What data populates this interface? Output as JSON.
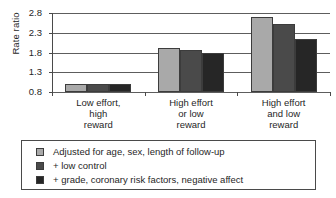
{
  "chart_data": {
    "type": "bar",
    "title": "",
    "xlabel": "",
    "ylabel": "Rate ratio",
    "ylim": [
      0.8,
      2.8
    ],
    "yticks": [
      "0.8",
      "1.3",
      "1.8",
      "2.3",
      "2.8"
    ],
    "grid": true,
    "legend_position": "bottom",
    "categories": [
      "Low effort,\nhigh\nreward",
      "High effort\nor low\nreward",
      "High effort\nand low\nreward"
    ],
    "category_lines": [
      [
        "Low effort,",
        "high",
        "reward"
      ],
      [
        "High effort",
        "or low",
        "reward"
      ],
      [
        "High effort",
        "and low",
        "reward"
      ]
    ],
    "series": [
      {
        "name": "Adjusted for age, sex, length of follow-up",
        "color": "#a9a9a9",
        "values": [
          1.0,
          1.91,
          2.7
        ]
      },
      {
        "name": "+ low control",
        "color": "#4a4a4a",
        "values": [
          1.0,
          1.87,
          2.52
        ]
      },
      {
        "name": "+ grade, coronary risk factors, negative affect",
        "color": "#262626",
        "values": [
          1.0,
          1.78,
          2.15
        ]
      }
    ]
  }
}
